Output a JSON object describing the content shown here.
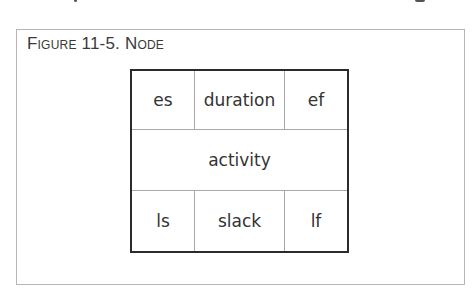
{
  "figure": {
    "caption": "Figure 11-5. Node",
    "node": {
      "top_row": [
        "es",
        "duration",
        "ef"
      ],
      "middle_row": "activity",
      "bottom_row": [
        "ls",
        "slack",
        "lf"
      ]
    }
  },
  "colors": {
    "frame_border": "#b5b5b5",
    "node_border": "#2b2b2b",
    "divider": "#a8a8a8",
    "text": "#333333"
  }
}
